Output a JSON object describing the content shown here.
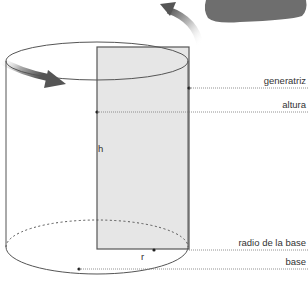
{
  "diagram": {
    "type": "cylinder-of-revolution",
    "colors": {
      "outline": "#555555",
      "rectangle_fill": "#e6e6e6",
      "arrow": "#666666",
      "blob": "#6e6e6e",
      "label": "#333333",
      "leader": "#777777"
    },
    "labels": {
      "generatriz": "generatriz",
      "altura": "altura",
      "radio": "radio de la base",
      "base": "base",
      "h": "h",
      "r": "r"
    },
    "icons": [
      "rotation-arrow-top",
      "rotation-arrow-left",
      "rotation-axis-blob"
    ]
  }
}
